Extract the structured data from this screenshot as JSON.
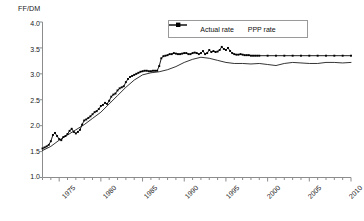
{
  "chart_data": {
    "type": "line",
    "title": "",
    "ylabel": "FF/DM",
    "xlabel": "",
    "ylim": [
      1.0,
      4.0
    ],
    "xlim": [
      1973,
      2010
    ],
    "yticks": [
      "1.0",
      "1.5",
      "2.0",
      "2.5",
      "3.0",
      "3.5",
      "4.0"
    ],
    "ytick_values": [
      1.0,
      1.5,
      2.0,
      2.5,
      3.0,
      3.5,
      4.0
    ],
    "xticks": [
      "1975",
      "1980",
      "1985",
      "1990",
      "1995",
      "2000",
      "2005",
      "2010"
    ],
    "xtick_values": [
      1975,
      1980,
      1985,
      1990,
      1995,
      2000,
      2005,
      2010
    ],
    "grid": false,
    "legend_position": "top-center",
    "series": [
      {
        "name": "Actual rate",
        "marker": "filled-square",
        "color": "#000000",
        "x": [
          1973.0,
          1973.25,
          1973.5,
          1973.75,
          1974.0,
          1974.25,
          1974.5,
          1974.75,
          1975.0,
          1975.25,
          1975.5,
          1975.75,
          1976.0,
          1976.25,
          1976.5,
          1976.75,
          1977.0,
          1977.25,
          1977.5,
          1977.75,
          1978.0,
          1978.25,
          1978.5,
          1978.75,
          1979.0,
          1979.25,
          1979.5,
          1979.75,
          1980.0,
          1980.25,
          1980.5,
          1980.75,
          1981.0,
          1981.25,
          1981.5,
          1981.75,
          1982.0,
          1982.25,
          1982.5,
          1982.75,
          1983.0,
          1983.25,
          1983.5,
          1983.75,
          1984.0,
          1984.25,
          1984.5,
          1984.75,
          1985.0,
          1985.25,
          1985.5,
          1985.75,
          1986.0,
          1986.25,
          1986.5,
          1986.75,
          1987.0,
          1987.25,
          1987.5,
          1987.75,
          1988.0,
          1988.25,
          1988.5,
          1988.75,
          1989.0,
          1989.25,
          1989.5,
          1989.75,
          1990.0,
          1990.25,
          1990.5,
          1990.75,
          1991.0,
          1991.25,
          1991.5,
          1991.75,
          1992.0,
          1992.25,
          1992.5,
          1992.75,
          1993.0,
          1993.25,
          1993.5,
          1993.75,
          1994.0,
          1994.25,
          1994.5,
          1994.75,
          1995.0,
          1995.25,
          1995.5,
          1995.75,
          1996.0,
          1996.25,
          1996.5,
          1996.75,
          1997.0,
          1997.25,
          1997.5,
          1997.75,
          1998.0,
          1998.25,
          1998.5,
          1998.75,
          1999.0,
          2000.0,
          2001.0,
          2002.0,
          2003.0,
          2004.0,
          2005.0,
          2006.0,
          2007.0,
          2008.0,
          2009.0,
          2010.0
        ],
        "y": [
          1.56,
          1.58,
          1.6,
          1.63,
          1.7,
          1.82,
          1.86,
          1.8,
          1.74,
          1.72,
          1.78,
          1.8,
          1.84,
          1.9,
          1.94,
          1.88,
          1.85,
          1.88,
          1.92,
          2.02,
          2.1,
          2.12,
          2.15,
          2.18,
          2.22,
          2.26,
          2.28,
          2.32,
          2.38,
          2.4,
          2.44,
          2.42,
          2.48,
          2.56,
          2.6,
          2.62,
          2.68,
          2.72,
          2.74,
          2.76,
          2.84,
          2.9,
          2.94,
          2.96,
          2.98,
          3.0,
          3.02,
          3.04,
          3.05,
          3.06,
          3.06,
          3.05,
          3.05,
          3.06,
          3.06,
          3.06,
          3.15,
          3.3,
          3.34,
          3.35,
          3.36,
          3.38,
          3.38,
          3.4,
          3.39,
          3.38,
          3.38,
          3.39,
          3.4,
          3.4,
          3.38,
          3.38,
          3.4,
          3.41,
          3.4,
          3.38,
          3.4,
          3.44,
          3.38,
          3.4,
          3.46,
          3.42,
          3.44,
          3.42,
          3.43,
          3.46,
          3.52,
          3.48,
          3.46,
          3.5,
          3.44,
          3.4,
          3.38,
          3.37,
          3.37,
          3.38,
          3.37,
          3.36,
          3.36,
          3.36,
          3.35,
          3.35,
          3.35,
          3.35,
          3.35,
          3.35,
          3.35,
          3.35,
          3.35,
          3.35,
          3.35,
          3.35,
          3.35,
          3.35,
          3.35,
          3.35
        ]
      },
      {
        "name": "PPP rate",
        "marker": "none",
        "color": "#000000",
        "x": [
          1973.0,
          1974.0,
          1975.0,
          1976.0,
          1977.0,
          1978.0,
          1979.0,
          1980.0,
          1981.0,
          1982.0,
          1983.0,
          1984.0,
          1985.0,
          1986.0,
          1987.0,
          1988.0,
          1989.0,
          1990.0,
          1991.0,
          1992.0,
          1993.0,
          1994.0,
          1995.0,
          1996.0,
          1997.0,
          1998.0,
          1999.0,
          2000.0,
          2001.0,
          2002.0,
          2003.0,
          2004.0,
          2005.0,
          2006.0,
          2007.0,
          2008.0,
          2009.0,
          2010.0
        ],
        "y": [
          1.52,
          1.6,
          1.72,
          1.82,
          1.92,
          2.02,
          2.14,
          2.26,
          2.42,
          2.58,
          2.74,
          2.88,
          2.98,
          3.02,
          3.04,
          3.08,
          3.14,
          3.22,
          3.28,
          3.32,
          3.3,
          3.26,
          3.22,
          3.2,
          3.2,
          3.19,
          3.2,
          3.18,
          3.16,
          3.2,
          3.22,
          3.21,
          3.2,
          3.2,
          3.22,
          3.22,
          3.21,
          3.22
        ]
      }
    ]
  },
  "legend": {
    "entries": [
      {
        "label": "Actual rate",
        "style": "line-with-marker"
      },
      {
        "label": "PPP rate",
        "style": "line"
      }
    ]
  },
  "colors": {
    "series": "#000000",
    "axis": "#8c8c8c",
    "text": "#1a1a1a",
    "background": "#ffffff",
    "legend_border": "#9a9a9a"
  }
}
